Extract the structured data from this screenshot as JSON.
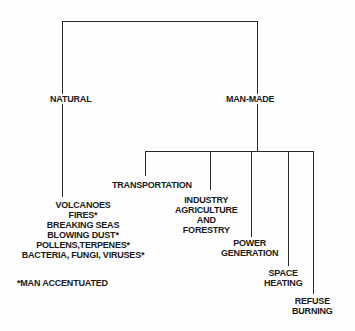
{
  "diagram": {
    "root_branches": [
      {
        "id": "natural",
        "label": "NATURAL"
      },
      {
        "id": "man-made",
        "label": "MAN-MADE"
      }
    ],
    "natural": {
      "sources": [
        "VOLCANOES",
        "FIRES*",
        "BREAKING SEAS",
        "BLOWING DUST*",
        "POLLENS,TERPENES*",
        "BACTERIA, FUNGI, VIRUSES*"
      ],
      "footnote": "*MAN ACCENTUATED"
    },
    "man_made": {
      "sources": [
        {
          "lines": [
            "TRANSPORTATION"
          ]
        },
        {
          "lines": [
            "INDUSTRY",
            "AGRICULTURE",
            "AND",
            "FORESTRY"
          ]
        },
        {
          "lines": [
            "POWER",
            "GENERATION"
          ]
        },
        {
          "lines": [
            "SPACE",
            "HEATING"
          ]
        },
        {
          "lines": [
            "REFUSE",
            "BURNING"
          ]
        }
      ]
    }
  }
}
